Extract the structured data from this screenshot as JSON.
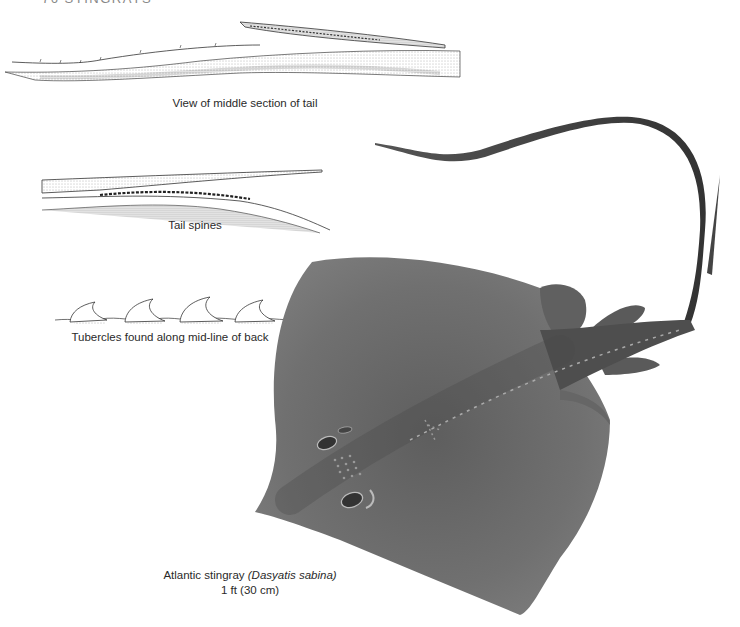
{
  "page": {
    "running_head": "76   STINGRAYS"
  },
  "figures": [
    {
      "id": "tail-middle",
      "caption": "View of middle section of tail"
    },
    {
      "id": "tail-spines",
      "caption": "Tail spines"
    },
    {
      "id": "tubercles",
      "caption": "Tubercles found along mid-line of back"
    }
  ],
  "main_figure": {
    "common_name": "Atlantic stingray",
    "scientific_name": "(Dasyatis sabina)",
    "size": "1 ft (30 cm)"
  },
  "colors": {
    "ray_body": "#6e6e6e",
    "ray_dark": "#4a4a4a",
    "line_art": "#333333",
    "background": "#ffffff"
  }
}
